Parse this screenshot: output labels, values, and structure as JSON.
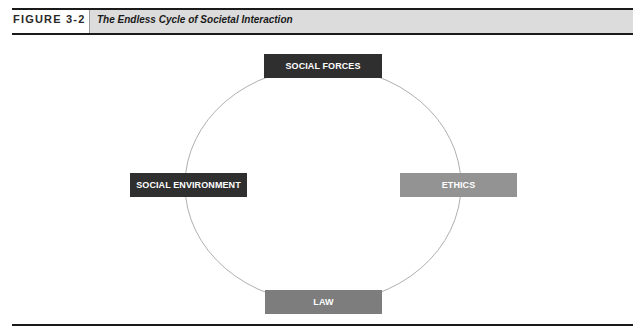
{
  "figure": {
    "label": "FIGURE 3-2",
    "title": "The Endless Cycle of Societal Interaction"
  },
  "diagram": {
    "type": "cycle",
    "nodes": [
      {
        "id": "social-forces",
        "label": "SOCIAL FORCES",
        "position": "top",
        "shade": "dark"
      },
      {
        "id": "ethics",
        "label": "ETHICS",
        "position": "right",
        "shade": "light"
      },
      {
        "id": "law",
        "label": "LAW",
        "position": "bottom",
        "shade": "mid"
      },
      {
        "id": "social-environment",
        "label": "SOCIAL ENVIRONMENT",
        "position": "left",
        "shade": "dark"
      }
    ],
    "colors": {
      "dark": "#2f2f2f",
      "mid": "#7d7d7d",
      "light": "#939393",
      "circle": "#9a9a9a"
    }
  }
}
